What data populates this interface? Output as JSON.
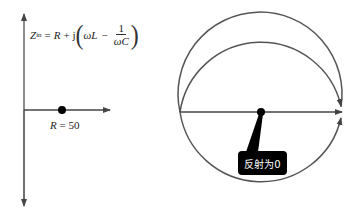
{
  "left_diagram": {
    "formula": {
      "lhs": "Z",
      "lhs_sub": "in",
      "equals": "=",
      "R": "R",
      "plus_j": "+ j",
      "omega_L": "ωL",
      "minus": "−",
      "frac_num": "1",
      "frac_den": "ωC"
    },
    "point_label": {
      "var": "R",
      "eq": " = 50"
    }
  },
  "right_diagram": {
    "callout_text": "反射为0"
  },
  "colors": {
    "line": "#555555",
    "dot": "#000000",
    "callout_bg": "#000000",
    "callout_text": "#ffffff"
  }
}
